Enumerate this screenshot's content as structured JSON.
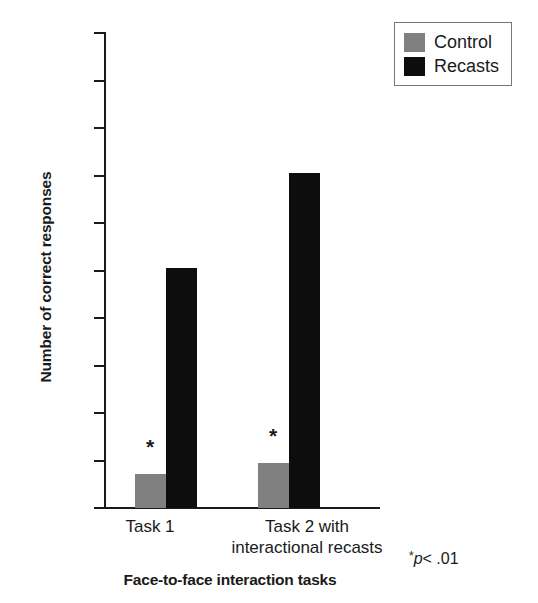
{
  "chart_data": {
    "type": "bar",
    "title": "",
    "xlabel": "Face-to-face interaction tasks",
    "ylabel": "Number of correct responses",
    "categories": [
      "Task 1",
      "Task 2 with interactional recasts"
    ],
    "category_lines": [
      [
        "Task 1"
      ],
      [
        "Task 2 with",
        "interactional recasts"
      ]
    ],
    "series": [
      {
        "name": "Control",
        "color": "#808080",
        "values": [
          0.72,
          0.95
        ]
      },
      {
        "name": "Recasts",
        "color": "#0d0d0d",
        "values": [
          5.05,
          7.05
        ]
      }
    ],
    "ylim": [
      0,
      10
    ],
    "ytick_labels": [
      "10",
      "9",
      "8",
      "7",
      "6",
      "5",
      "4",
      "3",
      "2",
      "1",
      "0"
    ],
    "ytick_values": [
      10,
      9,
      8,
      7,
      6,
      5,
      4,
      3,
      2,
      1,
      0
    ],
    "grid": false,
    "legend_position": "top-right",
    "annotations": [
      {
        "name": "significance-star-task1",
        "text": "*",
        "series": "Control",
        "category": "Task 1"
      },
      {
        "name": "significance-star-task2",
        "text": "*",
        "series": "Control",
        "category": "Task 2 with interactional recasts"
      }
    ],
    "footnote": {
      "asterisk": "*",
      "p_symbol": "p",
      "comparison": "< .01",
      "full": "*p < .01"
    }
  },
  "legend": {
    "items": [
      {
        "label": "Control",
        "color": "#808080"
      },
      {
        "label": "Recasts",
        "color": "#0d0d0d"
      }
    ]
  },
  "axes": {
    "y_title": "Number of correct responses",
    "x_title": "Face-to-face interaction tasks"
  }
}
